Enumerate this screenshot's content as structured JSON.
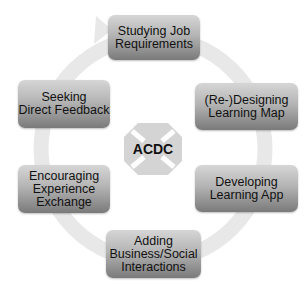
{
  "diagram": {
    "type": "cycle",
    "center": {
      "label": "ACDC",
      "icon": "four-way-arrows-icon"
    },
    "steps": [
      {
        "id": "step-1",
        "label": "Studying Job\nRequirements"
      },
      {
        "id": "step-2",
        "label": "(Re-)Designing\nLearning Map"
      },
      {
        "id": "step-3",
        "label": "Developing\nLearning App"
      },
      {
        "id": "step-4",
        "label": "Adding\nBusiness/Social\nInteractions"
      },
      {
        "id": "step-5",
        "label": "Encouraging\nExperience\nExchange"
      },
      {
        "id": "step-6",
        "label": "Seeking\nDirect Feedback"
      }
    ],
    "flow_direction": "clockwise",
    "colors": {
      "box_top": "#d6d6d6",
      "box_bottom": "#7a7a7a",
      "ring": "#e6e6e6",
      "center_shape": "#d4d4d4",
      "text": "#111111"
    }
  }
}
